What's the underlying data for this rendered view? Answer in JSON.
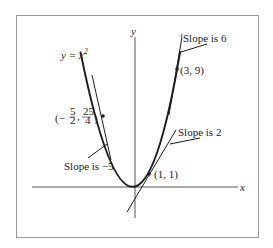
{
  "diagram": {
    "curve_label": "y = x",
    "curve_label_exponent": "2",
    "axes": {
      "x_label": "x",
      "y_label": "y"
    },
    "points": [
      {
        "id": "p1",
        "label": "(1, 1)",
        "x": 1,
        "y": 1,
        "slope": 2,
        "slope_label": "Slope is 2"
      },
      {
        "id": "p2",
        "label": "(3, 9)",
        "x": 3,
        "y": 9,
        "slope": 6,
        "slope_label": "Slope is 6"
      },
      {
        "id": "p3",
        "label_prefix": "(−",
        "frac1_num": "5",
        "frac1_den": "2",
        "sep": ",",
        "frac2_num": "25",
        "frac2_den": "4",
        "label_suffix": ")",
        "x": -2.5,
        "y": 6.25,
        "slope": -5,
        "slope_label": "Slope is −5"
      }
    ],
    "colors": {
      "line": "#1e1e1e",
      "frame": "#9a9a9a",
      "axis": "#555555"
    }
  }
}
